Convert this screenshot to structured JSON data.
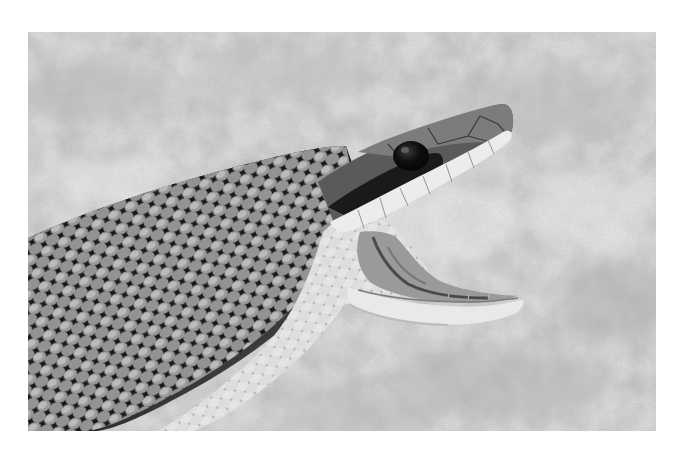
{
  "image": {
    "subject": "Snake with mouth wide open",
    "description": "Grayscale photograph of a snake's head and neck, jaws agape, against a blurred mottled ground",
    "style": "black-and-white photograph",
    "frame": {
      "x": 28,
      "y": 32,
      "width": 628,
      "height": 399
    },
    "colors": {
      "page_background": "#ffffff",
      "ground_light": "#e8e8e8",
      "ground_mid": "#c4c4c4",
      "scale_dark": "#1e1e1e",
      "scale_light": "#bdbdbd",
      "belly": "#e4e4e4",
      "eye": "#0c0c0c",
      "mouth_inner": "#9a9a9a"
    }
  }
}
